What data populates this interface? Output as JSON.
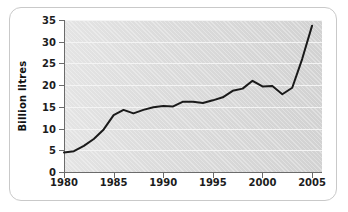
{
  "chart_data": {
    "type": "line",
    "title": "",
    "xlabel": "",
    "ylabel": "Billion litres",
    "xlim": [
      1980,
      2006
    ],
    "ylim": [
      0,
      35
    ],
    "grid": true,
    "legend": "none",
    "x_ticks": [
      1980,
      1985,
      1990,
      1995,
      2000,
      2005
    ],
    "y_ticks": [
      0,
      5,
      10,
      15,
      20,
      25,
      30,
      35
    ],
    "x": [
      1980,
      1981,
      1982,
      1983,
      1984,
      1985,
      1986,
      1987,
      1988,
      1989,
      1990,
      1991,
      1992,
      1993,
      1994,
      1995,
      1996,
      1997,
      1998,
      1999,
      2000,
      2001,
      2002,
      2003,
      2004,
      2005
    ],
    "values": [
      4.5,
      4.8,
      6.0,
      7.6,
      9.8,
      13.1,
      14.3,
      13.5,
      14.3,
      14.9,
      15.2,
      15.1,
      16.2,
      16.2,
      15.9,
      16.5,
      17.2,
      18.7,
      19.2,
      21.0,
      19.7,
      19.8,
      17.9,
      19.4,
      26.0,
      33.7
    ],
    "series_color": "#1a1a1a",
    "plot_bg": "#d9d9d9",
    "gridline_color": "#f4f4f4"
  },
  "axis": {
    "y_tick_labels": [
      "35",
      "30",
      "25",
      "20",
      "15",
      "10",
      "5",
      "0"
    ],
    "x_tick_labels": [
      "1980",
      "1985",
      "1990",
      "1995",
      "2000",
      "2005"
    ],
    "y_title": "Billion litres"
  }
}
